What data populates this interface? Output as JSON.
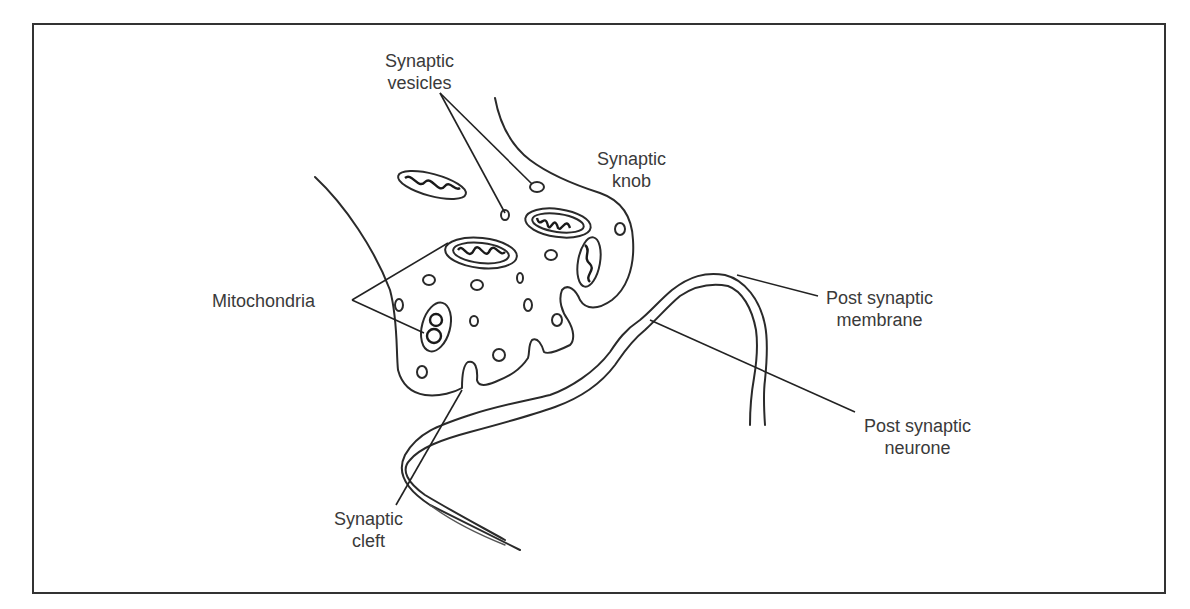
{
  "diagram": {
    "labels": {
      "synaptic_vesicles": [
        "Synaptic",
        "vesicles"
      ],
      "synaptic_knob": [
        "Synaptic",
        "knob"
      ],
      "mitochondria": [
        "Mitochondria"
      ],
      "post_synaptic_membrane": [
        "Post synaptic",
        "membrane"
      ],
      "post_synaptic_neurone": [
        "Post synaptic",
        "neurone"
      ],
      "synaptic_cleft": [
        "Synaptic",
        "cleft"
      ]
    },
    "colors": {
      "ink": "#2a2a2a",
      "text": "#3a3a3a",
      "background": "#ffffff",
      "frame": "#333333"
    }
  }
}
